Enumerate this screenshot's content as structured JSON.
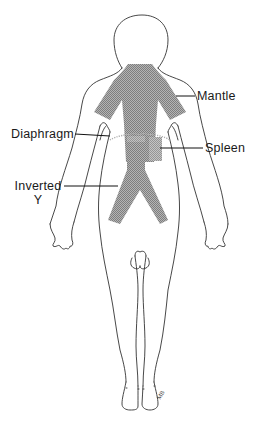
{
  "diagram": {
    "labels": {
      "mantle": "Mantle",
      "diaphragm": "Diaphragm",
      "spleen": "Spleen",
      "inverted_line1": "Inverted",
      "inverted_line2": "Y"
    },
    "signature": "MB",
    "colors": {
      "outline": "#333333",
      "field_fill": "#a8a8a8",
      "field_hatch": "#8a8a8a",
      "leader_line": "#111111",
      "diaphragm_line": "#b0b0b0",
      "background": "#ffffff"
    }
  }
}
